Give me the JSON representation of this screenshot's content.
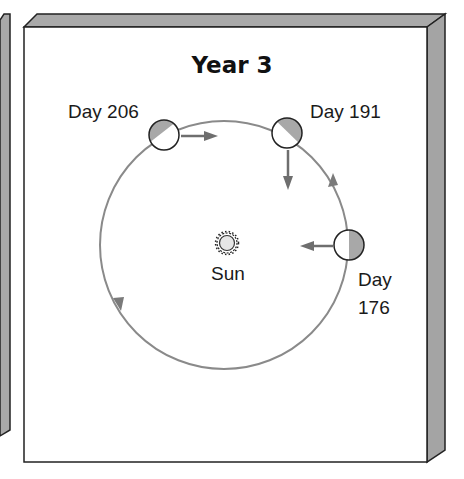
{
  "title": "Year 3",
  "sun": {
    "label": "Sun"
  },
  "planets": [
    {
      "label": "Day 206",
      "day": 206,
      "velocity_arrow": "right"
    },
    {
      "label": "Day 191",
      "day": 191,
      "velocity_arrow": "down"
    },
    {
      "label_line1": "Day",
      "label_line2": "176",
      "day": 176,
      "velocity_arrow": "left"
    }
  ],
  "orbit": {
    "direction": "counterclockwise"
  },
  "colors": {
    "panel_face": "#ffffff",
    "panel_bevel": "#a9a9a9",
    "outline": "#222222",
    "orbit": "#8a8a8a",
    "arrow": "#6e6e6e",
    "planet_shade": "#a8a8a8"
  }
}
